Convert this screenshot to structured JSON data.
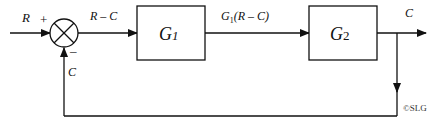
{
  "diagram": {
    "type": "block-diagram",
    "input_label": "R",
    "plus_sign": "+",
    "minus_sign": "–",
    "error_label": "R – C",
    "feedback_label": "C",
    "block1": {
      "label": "G",
      "sub": "1"
    },
    "intermediate_label": {
      "main": "G",
      "sub": "1",
      "rest": "(R – C)"
    },
    "block2": {
      "label": "G",
      "sub": "2"
    },
    "output_label": "C",
    "copyright": "©SLG",
    "colors": {
      "line": "#111111",
      "background": "#ffffff"
    }
  }
}
